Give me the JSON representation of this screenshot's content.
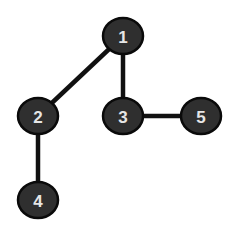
{
  "diagram": {
    "type": "tree-graph",
    "background": "#ffffff",
    "node_fill": "#2f2f2f",
    "node_stroke": "#0a0a0a",
    "label_color": "#e6e6e6",
    "edge_color": "#111111",
    "nodes": [
      {
        "id": "1",
        "label": "1",
        "cx": 123,
        "cy": 36,
        "rx": 20,
        "ry": 18
      },
      {
        "id": "2",
        "label": "2",
        "cx": 38,
        "cy": 116,
        "rx": 20,
        "ry": 18
      },
      {
        "id": "3",
        "label": "3",
        "cx": 123,
        "cy": 116,
        "rx": 20,
        "ry": 18
      },
      {
        "id": "5",
        "label": "5",
        "cx": 201,
        "cy": 116,
        "rx": 20,
        "ry": 18
      },
      {
        "id": "4",
        "label": "4",
        "cx": 38,
        "cy": 200,
        "rx": 20,
        "ry": 18
      }
    ],
    "edges": [
      {
        "from": "1",
        "to": "2"
      },
      {
        "from": "1",
        "to": "3"
      },
      {
        "from": "3",
        "to": "5"
      },
      {
        "from": "2",
        "to": "4"
      }
    ]
  }
}
